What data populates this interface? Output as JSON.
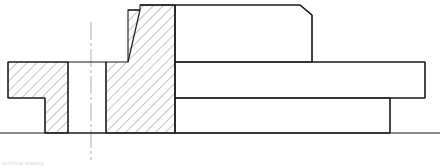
{
  "document": {
    "title": "Mechanical Cross-Section Drawing",
    "view_type": "Sectional view (half section)",
    "caption": "technical drawing",
    "background_color": "#ffffff",
    "line_color": "#1a1a1a",
    "hatch_color": "#2b2b2b",
    "centerline_color": "#9a9a9a"
  },
  "drawing": {
    "canvas": {
      "width": 440,
      "height": 166
    },
    "line_weights": {
      "outline": 1.1,
      "hatch": 0.55,
      "centerline": 0.8
    },
    "hatch": {
      "angle_degrees": 45,
      "spacing_px": 7,
      "description": "section hatching, 45 degrees, uniform spacing"
    },
    "centerlines": [
      {
        "name": "vertical-centerline",
        "orientation": "vertical",
        "x": 91,
        "y1": 22,
        "y2": 160,
        "dash_pattern": "18 3 3 3"
      },
      {
        "name": "horizontal-centerline",
        "orientation": "horizontal",
        "y": 133,
        "x1": 0,
        "x2": 440,
        "dash_pattern": "none"
      }
    ],
    "regions": [
      {
        "name": "left-flange-hatched",
        "hatched": true,
        "points": "8,62 68,62 68,133 45,133 45,98 8,98"
      },
      {
        "name": "main-body-hatched",
        "hatched": true,
        "points": "128,10 140,10 140,5 175,5 175,133 106,133 106,62 128,62"
      }
    ],
    "outlines": [
      {
        "name": "upper-flange-band",
        "points": "140,5 300,5 312,15 312,62 175,62 175,5",
        "closed": true
      },
      {
        "name": "right-shaft-upper-band",
        "points": "175,62 425,62 425,98 175,98",
        "closed": true
      },
      {
        "name": "right-shaft-lower-band",
        "points": "175,98 390,98 390,133 175,133",
        "closed": true
      }
    ],
    "features": [
      {
        "name": "chamfer-top-left-main-body",
        "type": "chamfer",
        "at": "128,62 to 140,10"
      },
      {
        "name": "chamfer-top-right-upper-band",
        "type": "chamfer",
        "at": "300,5 to 312,15"
      },
      {
        "name": "groove-slot-unhatched",
        "type": "slot",
        "x_range": [
          68,
          106
        ],
        "y_range": [
          62,
          133
        ]
      },
      {
        "name": "step-left-flange",
        "type": "step",
        "at": "45,98"
      }
    ]
  }
}
